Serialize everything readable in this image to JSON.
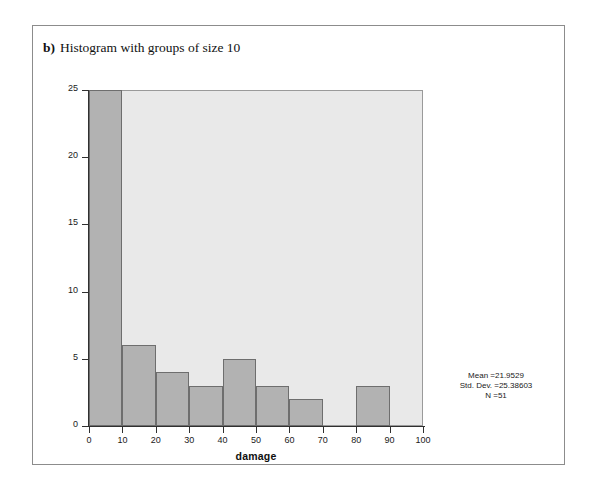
{
  "caption": {
    "letter": "b)",
    "text": "Histogram with groups of size 10"
  },
  "chart_data": {
    "type": "bar",
    "title": "",
    "xlabel": "damage",
    "ylabel": "Frequency",
    "bin_width": 10,
    "bin_starts": [
      0,
      10,
      20,
      30,
      40,
      50,
      60,
      70,
      80,
      90
    ],
    "categories": [
      "0-10",
      "10-20",
      "20-30",
      "30-40",
      "40-50",
      "50-60",
      "60-70",
      "70-80",
      "80-90",
      "90-100"
    ],
    "values": [
      25,
      6,
      4,
      3,
      5,
      3,
      2,
      0,
      3,
      0
    ],
    "xlim": [
      0,
      100
    ],
    "ylim": [
      0,
      25
    ],
    "x_ticks": [
      0,
      10,
      20,
      30,
      40,
      50,
      60,
      70,
      80,
      90,
      100
    ],
    "y_ticks": [
      0,
      5,
      10,
      15,
      20,
      25
    ],
    "grid": false,
    "legend": "none",
    "bar_color": "#b2b2b2",
    "bar_edge_color": "#6e6e6e",
    "plot_background": "#e9e9e9"
  },
  "stats": {
    "mean": "Mean =21.9529",
    "std_dev": "Std. Dev. =25.38603",
    "n": "N =51"
  }
}
